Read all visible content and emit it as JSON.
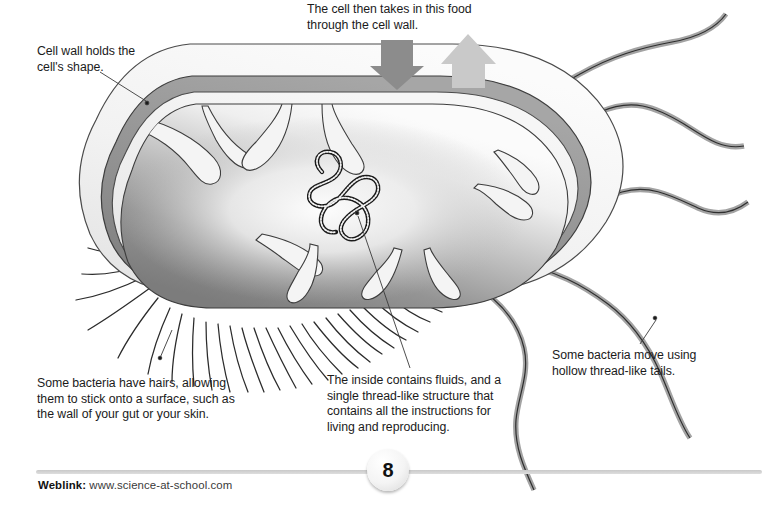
{
  "page": {
    "page_number": "8",
    "background_color": "#ffffff",
    "text_color": "#1b1b1b"
  },
  "captions": {
    "cell_wall": "Cell wall holds the\ncell's shape.",
    "takes_in_food": "The cell then takes in this food\nthrough the cell wall.",
    "hairs": "Some bacteria have hairs, allowing\nthem to stick onto a surface, such as\nthe wall of your gut or your skin.",
    "inside": "The inside contains fluids, and a\nsingle thread-like structure that\ncontains all the instructions for\nliving and reproducing.",
    "tails": "Some bacteria move using\nhollow thread-like tails."
  },
  "footer": {
    "weblink_label": "Weblink:",
    "weblink_url": "www.science-at-school.com",
    "page_number": "8"
  },
  "diagram": {
    "type": "labelled-biology-illustration",
    "parts": [
      {
        "name": "capsule",
        "fill": "#f2f2f2",
        "stroke": "#4a4a4a"
      },
      {
        "name": "cell-wall-band",
        "fill": "#8f8f8f",
        "stroke": "#3d3d3d"
      },
      {
        "name": "cell-membrane",
        "fill": "#ededed",
        "stroke": "#4a4a4a"
      },
      {
        "name": "cytoplasm",
        "fill": "#9b9b9b",
        "stroke": "#3d3d3d"
      },
      {
        "name": "dna-thread",
        "fill": "#f0f0f0",
        "stroke": "#1a1a1a"
      },
      {
        "name": "mesosome-folds",
        "fill": "#f4f4f4",
        "stroke": "#3d3d3d"
      },
      {
        "name": "pili-hairs",
        "stroke": "#2b2b2b",
        "count": 26
      },
      {
        "name": "flagella-tails",
        "fill": "#a8a8a8",
        "stroke": "#2e2e2e",
        "count": 5
      }
    ],
    "arrows": [
      {
        "name": "food-in-arrow",
        "direction": "down",
        "fill": "#8c8c8c"
      },
      {
        "name": "waste-out-arrow",
        "direction": "up",
        "fill": "#c9c9c9"
      }
    ],
    "leader_lines": [
      {
        "from": "cell_wall",
        "to_x": 147,
        "to_y": 103
      },
      {
        "from": "hairs",
        "to_x": 160,
        "to_y": 358
      },
      {
        "from": "inside",
        "to_x": 357,
        "to_y": 213
      },
      {
        "from": "tails",
        "to_x": 655,
        "to_y": 318
      }
    ]
  }
}
